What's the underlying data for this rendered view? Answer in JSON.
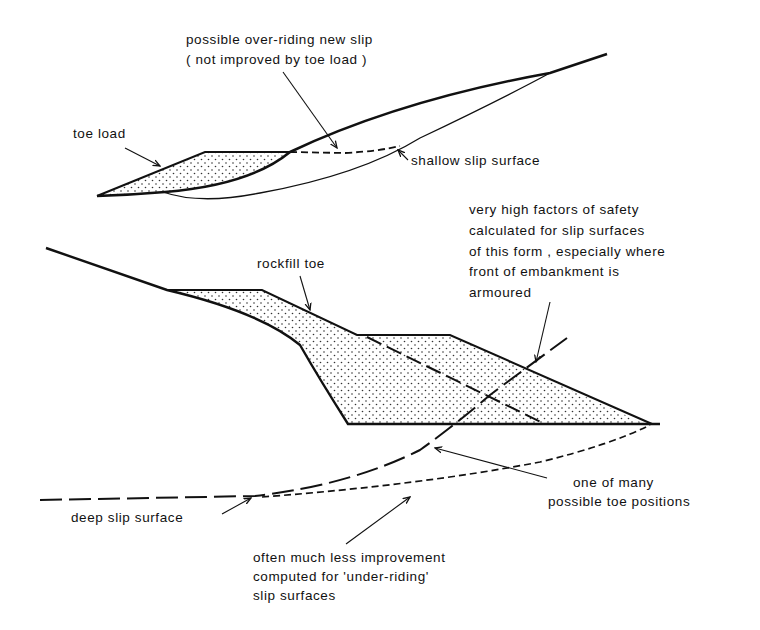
{
  "figure": {
    "type": "geotechnical slope stability diagram",
    "colors": {
      "ink": "#111111",
      "background": "#ffffff",
      "hatch": "#333333"
    }
  },
  "upper_diagram": {
    "labels": {
      "over_riding_line1": "possible over-riding new slip",
      "over_riding_line2": "( not improved by toe load )",
      "toe_load": "toe load",
      "shallow_slip": "shallow slip surface"
    }
  },
  "lower_diagram": {
    "labels": {
      "high_fos_line1": "very high factors of safety",
      "high_fos_line2": "calculated for slip surfaces",
      "high_fos_line3": "of this form , especially where",
      "high_fos_line4": "front of embankment is",
      "high_fos_line5": "armoured",
      "rockfill_toe": "rockfill toe",
      "toe_positions_line1": "one of many",
      "toe_positions_line2": "possible toe positions",
      "deep_slip": "deep slip surface",
      "under_riding_line1": "often much less improvement",
      "under_riding_line2": "computed for 'under-riding'",
      "under_riding_line3": "slip surfaces"
    }
  }
}
